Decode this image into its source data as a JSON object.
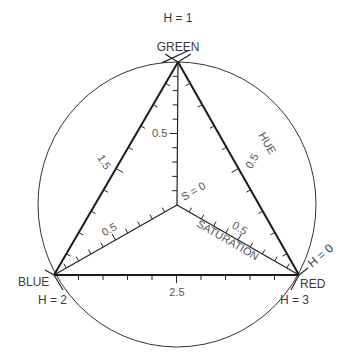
{
  "diagram": {
    "vertices": {
      "green": {
        "label": "GREEN",
        "hue_label": "H = 1"
      },
      "blue": {
        "label": "BLUE",
        "hue_label": "H = 2"
      },
      "red": {
        "label": "RED",
        "hue_label_top": "H = 0",
        "hue_label_bottom": "H = 3"
      }
    },
    "center": {
      "label": "S = 0"
    },
    "axes": {
      "hue": {
        "label": "HUE",
        "mid_value": "0.5"
      },
      "saturation": {
        "label": "SATURATION",
        "mid_value": "0.5"
      },
      "green_axis_mid": "0.5",
      "blue_axis_mid": "0.5",
      "left_edge_mid": "1.5",
      "bottom_edge_mid": "2.5"
    },
    "ticks_per_edge": 10,
    "colors": {
      "line": "#1a1a1a",
      "text": "#3a3a3a",
      "background": "#ffffff"
    }
  }
}
